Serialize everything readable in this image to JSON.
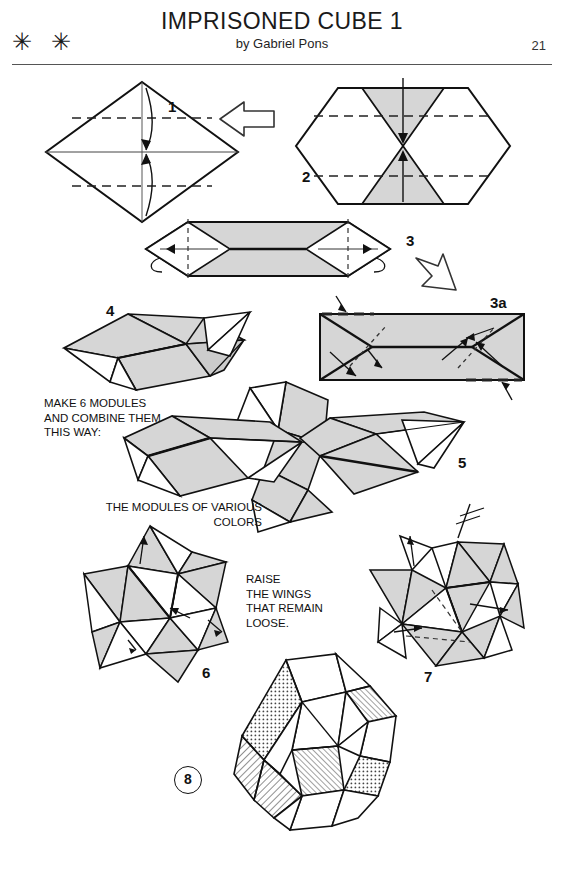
{
  "header": {
    "title": "IMPRISONED CUBE 1",
    "byline": "by Gabriel Pons",
    "difficulty": "✳ ✳",
    "difficulty_name": "two-star-difficulty",
    "page_number": "21"
  },
  "steps": [
    {
      "id": "step-1",
      "label": "1",
      "description": "square rotated 45 degrees with horizontal valley fold lines and fold arrows to center"
    },
    {
      "id": "step-2",
      "label": "2",
      "description": "hexagon with two shaded triangles folded toward the center"
    },
    {
      "id": "step-3",
      "label": "3",
      "description": "flattened elongated hexagon with curved fold-back arrows at both ends"
    },
    {
      "id": "step-3a",
      "label": "3a",
      "description": "shaded rectangle with diagonal creases and direction arrows"
    },
    {
      "id": "step-4",
      "label": "4",
      "description": "finished three dimensional module with triangular wings"
    },
    {
      "id": "step-5",
      "label": "5",
      "description": "three modules interlocked together"
    },
    {
      "id": "step-6",
      "label": "6",
      "description": "partially assembled star shaped cluster of modules"
    },
    {
      "id": "step-7",
      "label": "7",
      "description": "assembly with wings being raised"
    },
    {
      "id": "step-8",
      "label": "8",
      "description": "completed imprisoned cube with textured faces"
    }
  ],
  "notes": [
    {
      "id": "note-make-modules",
      "text": "MAKE 6 MODULES\nAND COMBINE THEM\nTHIS WAY:"
    },
    {
      "id": "note-various-colors",
      "text": "THE MODULES OF VARIOUS\nCOLORS"
    },
    {
      "id": "note-raise-wings",
      "text": "RAISE\nTHE WINGS\nTHAT REMAIN\nLOOSE."
    }
  ],
  "arrows": [
    {
      "id": "arrow-step1-to-step2",
      "direction": "right"
    },
    {
      "id": "arrow-step3-to-step3a",
      "direction": "down-right"
    }
  ],
  "colors": {
    "paper_shaded": "#d6d6d6",
    "paper_shaded_dark": "#bfbfbf",
    "paper_white": "#ffffff",
    "ink": "#111111",
    "rule": "#555555"
  }
}
